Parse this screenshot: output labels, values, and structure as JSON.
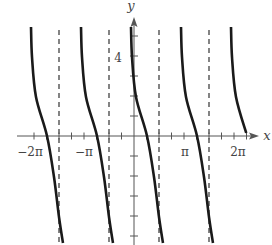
{
  "chart_data": {
    "type": "line",
    "title": "",
    "xlabel": "x",
    "ylabel": "y",
    "xlim_pi": [
      -2.35,
      2.5
    ],
    "ylim": [
      -5.45,
      5.9
    ],
    "x_unit": "pi",
    "x_tick_step_pi": 0.25,
    "y_tick_step": 1,
    "x_tick_labels": [
      {
        "value_pi": -2,
        "label": "−2π"
      },
      {
        "value_pi": -1,
        "label": "−π"
      },
      {
        "value_pi": 1,
        "label": "π"
      },
      {
        "value_pi": 2,
        "label": "2π"
      }
    ],
    "y_tick_labels": [
      {
        "value": 4,
        "label": "4"
      }
    ],
    "asymptotes_pi": [
      -1.5,
      -0.5,
      0.5,
      1.5
    ],
    "grid": false,
    "series": [
      {
        "name": "branch-center",
        "description": "decreasing tangent-like branch between asymptotes -π/2 and π/2",
        "points_pi": [
          [
            -0.06,
            5.45
          ],
          [
            -0.04,
            3.95
          ],
          [
            0.04,
            1.95
          ],
          [
            0.26,
            0
          ],
          [
            0.4,
            -2.05
          ],
          [
            0.5,
            -4.05
          ],
          [
            0.58,
            -5.35
          ]
        ]
      }
    ],
    "branch_shifts_pi": [
      -2,
      -1,
      0,
      1,
      2
    ],
    "last_branch_min_y": 0.15,
    "zero_crossings_pi": [
      -1.75,
      -0.75,
      0.25,
      1.25
    ]
  },
  "labels": {
    "x_axis": "x",
    "y_axis": "y",
    "y_tick_4": "4",
    "x_tick_neg2pi": "−2π",
    "x_tick_negpi": "−π",
    "x_tick_pi": "π",
    "x_tick_2pi": "2π"
  },
  "colors": {
    "curve": "#1a1a1a",
    "axis": "#555555",
    "asymptote": "#333333",
    "label": "#444444"
  }
}
